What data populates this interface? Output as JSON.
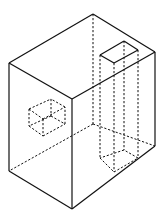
{
  "diagram": {
    "type": "isometric-solid",
    "line_color": "#111111",
    "background": "#ffffff",
    "outer_block": {
      "visible_edges": [
        [
          9,
          63,
          93,
          14
        ],
        [
          93,
          14,
          155,
          52
        ],
        [
          155,
          52,
          72,
          99
        ],
        [
          72,
          99,
          9,
          63
        ],
        [
          9,
          63,
          9,
          171
        ],
        [
          72,
          99,
          72,
          209
        ],
        [
          155,
          52,
          155,
          146
        ],
        [
          9,
          171,
          72,
          209
        ],
        [
          72,
          209,
          155,
          146
        ]
      ],
      "hidden_edges": [
        [
          93,
          14,
          93,
          124
        ],
        [
          93,
          124,
          9,
          171
        ],
        [
          93,
          124,
          155,
          146
        ]
      ]
    },
    "through_hole": {
      "top_opening": [
        [
          100,
          55
        ],
        [
          124,
          41
        ],
        [
          138,
          50
        ],
        [
          114,
          63
        ]
      ],
      "hidden_edges": [
        [
          100,
          55,
          100,
          158
        ],
        [
          114,
          63,
          114,
          172
        ],
        [
          124,
          41,
          124,
          150
        ],
        [
          138,
          50,
          138,
          156
        ],
        [
          100,
          158,
          114,
          172
        ],
        [
          114,
          172,
          138,
          158
        ],
        [
          138,
          158,
          124,
          150
        ],
        [
          124,
          150,
          100,
          158
        ]
      ]
    },
    "side_cavity": {
      "hidden_edges": [
        [
          29,
          109,
          51,
          99
        ],
        [
          51,
          99,
          51,
          116
        ],
        [
          29,
          109,
          29,
          126
        ],
        [
          29,
          126,
          43,
          136
        ],
        [
          43,
          136,
          65,
          124
        ],
        [
          65,
          124,
          65,
          107
        ],
        [
          65,
          107,
          51,
          99
        ],
        [
          29,
          109,
          43,
          119
        ],
        [
          43,
          119,
          65,
          107
        ],
        [
          43,
          119,
          43,
          136
        ],
        [
          51,
          116,
          29,
          126
        ],
        [
          51,
          116,
          65,
          124
        ]
      ]
    }
  }
}
